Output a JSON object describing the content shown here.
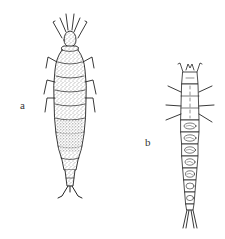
{
  "figure": {
    "background": "#ffffff",
    "ink_color": "#222222",
    "specimens": [
      {
        "id": "a",
        "label": "a",
        "description": "stout larva with stippled body, antennae, three pairs of legs and forked tail"
      },
      {
        "id": "b",
        "label": "b",
        "description": "slender larva with segmented abdomen bearing oval markings, three pairs of legs and long forked cerci"
      }
    ]
  }
}
